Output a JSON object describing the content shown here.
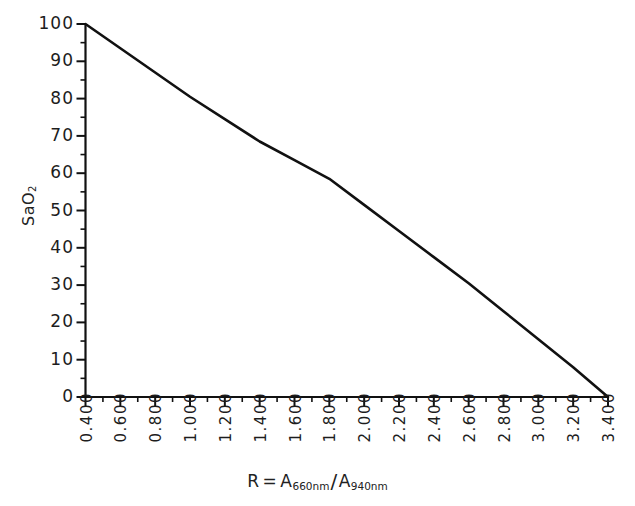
{
  "chart_data": {
    "type": "line",
    "title": "",
    "xlabel": "R = A660nm / A940nm",
    "ylabel": "SaO2",
    "xlabel_parts": {
      "r": "R",
      "equals": "=",
      "a1": "A",
      "a1_sub": "660nm",
      "slash": "/",
      "a2": "A",
      "a2_sub": "940nm"
    },
    "ylabel_parts": {
      "base": "SaO",
      "sub": "2"
    },
    "xlim": [
      0.4,
      3.4
    ],
    "ylim": [
      0,
      100
    ],
    "grid": false,
    "legend": null,
    "x_major_step": 0.2,
    "x_minor_step": 0.1,
    "y_major_step": 10,
    "y_minor_step": 5,
    "xticklabels": [
      "0.400",
      "0.600",
      "0.800",
      "1.000",
      "1.200",
      "1.400",
      "1.600",
      "1.800",
      "2.000",
      "2.200",
      "2.400",
      "2.600",
      "2.800",
      "3.000",
      "3.200",
      "3.400"
    ],
    "xtickvalues": [
      0.4,
      0.6,
      0.8,
      1.0,
      1.2,
      1.4,
      1.6,
      1.8,
      2.0,
      2.2,
      2.4,
      2.6,
      2.8,
      3.0,
      3.2,
      3.4
    ],
    "yticklabels": [
      "0",
      "10",
      "20",
      "30",
      "40",
      "50",
      "60",
      "70",
      "80",
      "90",
      "100"
    ],
    "ytickvalues": [
      0,
      10,
      20,
      30,
      40,
      50,
      60,
      70,
      80,
      90,
      100
    ],
    "series": [
      {
        "name": "SaO2 calibration curve",
        "color": "#111111",
        "x": [
          0.4,
          0.6,
          0.8,
          1.0,
          1.2,
          1.4,
          1.6,
          1.8,
          2.0,
          2.2,
          2.4,
          2.6,
          2.8,
          3.0,
          3.2,
          3.4
        ],
        "y": [
          100.0,
          93.5,
          87.0,
          80.5,
          74.5,
          68.5,
          63.5,
          58.5,
          51.5,
          44.5,
          37.5,
          30.5,
          23.0,
          15.5,
          8.0,
          0.0
        ]
      }
    ]
  },
  "colors": {
    "background": "#ffffff",
    "ink": "#111111",
    "text": "#1d1d1d"
  }
}
